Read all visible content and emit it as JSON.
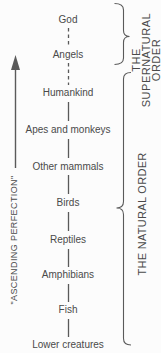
{
  "colors": {
    "background": "#fcfcfc",
    "ink": "#4a4a4a",
    "line": "#5a5a5a"
  },
  "ladder": {
    "levels": [
      {
        "label": "God"
      },
      {
        "label": "Angels"
      },
      {
        "label": "Humankind"
      },
      {
        "label": "Apes and monkeys"
      },
      {
        "label": "Other mammals"
      },
      {
        "label": "Birds"
      },
      {
        "label": "Reptiles"
      },
      {
        "label": "Amphibians"
      },
      {
        "label": "Fish"
      },
      {
        "label": "Lower creatures"
      }
    ]
  },
  "arrow": {
    "label": "\"ASCENDING PERFECTION\""
  },
  "brackets": {
    "supernatural": {
      "lines": [
        "THE",
        "SUPERNATURAL",
        "ORDER"
      ]
    },
    "natural": {
      "label": "THE NATURAL ORDER"
    }
  }
}
